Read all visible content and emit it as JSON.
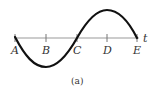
{
  "diagram": {
    "type": "sine-wave",
    "axis_label": "t",
    "caption": "(a)",
    "points": [
      {
        "label": "A",
        "x": 15
      },
      {
        "label": "B",
        "x": 46
      },
      {
        "label": "C",
        "x": 77
      },
      {
        "label": "D",
        "x": 107
      },
      {
        "label": "E",
        "x": 137
      }
    ],
    "colors": {
      "axis": "#999999",
      "curve": "#111111",
      "text": "#333333"
    }
  }
}
